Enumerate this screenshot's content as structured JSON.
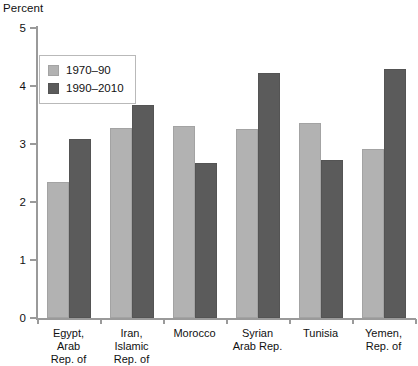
{
  "chart_data": {
    "type": "bar",
    "title": "",
    "subtitle": "",
    "xlabel": "",
    "ylabel": "Percent",
    "ylim": [
      0,
      5
    ],
    "yticks": [
      0,
      1,
      2,
      3,
      4,
      5
    ],
    "ytick_labels": [
      "0",
      "1",
      "2",
      "3",
      "4",
      "5"
    ],
    "grid": false,
    "legend_position": "top-left",
    "categories": [
      "Egypt,\nArab\nRep. of",
      "Iran,\nIslamic\nRep. of",
      "Morocco",
      "Syrian\nArab Rep.",
      "Tunisia",
      "Yemen,\nRep. of"
    ],
    "category_lines": [
      [
        "Egypt,",
        "Arab",
        "Rep. of"
      ],
      [
        "Iran,",
        "Islamic",
        "Rep. of"
      ],
      [
        "Morocco"
      ],
      [
        "Syrian",
        "Arab Rep."
      ],
      [
        "Tunisia"
      ],
      [
        "Yemen,",
        "Rep. of"
      ]
    ],
    "series": [
      {
        "name": "1970–90",
        "color": "#b2b2b2",
        "values": [
          2.34,
          3.27,
          3.31,
          3.26,
          3.37,
          2.91
        ]
      },
      {
        "name": "1990–2010",
        "color": "#5b5b5b",
        "values": [
          3.08,
          3.67,
          2.67,
          4.23,
          2.73,
          4.29
        ]
      }
    ]
  },
  "legend": {
    "entries": [
      {
        "label": "1970–90"
      },
      {
        "label": "1990–2010"
      }
    ]
  },
  "axis": {
    "y_title": "Percent"
  }
}
